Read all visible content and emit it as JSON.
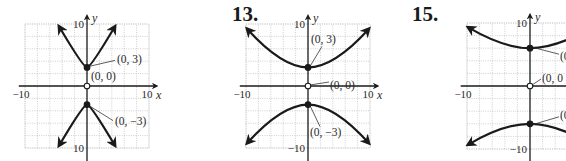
{
  "chart_data": [
    {
      "type": "line",
      "panel": "left",
      "problem_number": "",
      "title": "",
      "xlabel": "x",
      "ylabel": "y",
      "xlim": [
        -10,
        10
      ],
      "ylim": [
        -10,
        10
      ],
      "grid": true,
      "tick_labels": {
        "x_min": "−10",
        "x_max": "10",
        "y_max": "10",
        "y_min": "10"
      },
      "origin_px": [
        87,
        86
      ],
      "unit_px": 6.2,
      "series": [
        {
          "name": "upper branch",
          "vertex": [
            0,
            3
          ],
          "ends": [
            [
              -4.5,
              9.6
            ],
            [
              4.5,
              9.6
            ]
          ],
          "shape": "steep"
        },
        {
          "name": "lower branch",
          "vertex": [
            0,
            -3
          ],
          "ends": [
            [
              -4.5,
              -9.6
            ],
            [
              4.5,
              -9.6
            ]
          ],
          "shape": "steep"
        }
      ],
      "points": [
        {
          "label": "(0, 3)",
          "x": 0,
          "y": 3,
          "filled": true
        },
        {
          "label": "(0, 0)",
          "x": 0,
          "y": 0,
          "filled": false
        },
        {
          "label": "(0, −3)",
          "x": 0,
          "y": -3,
          "filled": true
        }
      ]
    },
    {
      "type": "line",
      "panel": "middle",
      "problem_number": "13.",
      "title": "",
      "xlabel": "x",
      "ylabel": "y",
      "xlim": [
        -10,
        10
      ],
      "ylim": [
        -10,
        10
      ],
      "grid": true,
      "tick_labels": {
        "x_min": "−10",
        "x_max": "10",
        "y_max": "10",
        "y_min": "−10"
      },
      "origin_px": [
        308,
        86
      ],
      "unit_px": 6.2,
      "series": [
        {
          "name": "upper branch",
          "vertex": [
            0,
            3
          ],
          "ends": [
            [
              -9.8,
              9.2
            ],
            [
              9.8,
              9.2
            ]
          ],
          "shape": "wide"
        },
        {
          "name": "lower branch",
          "vertex": [
            0,
            -3
          ],
          "ends": [
            [
              -9.8,
              -9.2
            ],
            [
              9.8,
              -9.2
            ]
          ],
          "shape": "wide"
        }
      ],
      "points": [
        {
          "label": "(0, 3)",
          "x": 0,
          "y": 3,
          "filled": true
        },
        {
          "label": "(0, 0)",
          "x": 0,
          "y": 0,
          "filled": false
        },
        {
          "label": "(0, −3)",
          "x": 0,
          "y": -3,
          "filled": true
        }
      ]
    },
    {
      "type": "line",
      "panel": "right",
      "problem_number": "15.",
      "title": "",
      "xlabel": "x",
      "ylabel": "y",
      "xlim": [
        -10,
        10
      ],
      "ylim": [
        -10,
        10
      ],
      "grid": true,
      "tick_labels": {
        "x_min": "−10",
        "x_max": "",
        "y_max": "10",
        "y_min": "−10"
      },
      "origin_px": [
        530,
        86
      ],
      "unit_px": 6.3,
      "series": [
        {
          "name": "upper branch",
          "vertex": [
            0,
            6
          ],
          "ends": [
            [
              -9.8,
              9.3
            ],
            [
              9.8,
              9.3
            ]
          ],
          "shape": "wide"
        },
        {
          "name": "lower branch",
          "vertex": [
            0,
            -6
          ],
          "ends": [
            [
              -9.8,
              -9.3
            ],
            [
              9.8,
              -9.3
            ]
          ],
          "shape": "wide"
        }
      ],
      "points": [
        {
          "label": "(0",
          "x": 0,
          "y": 6,
          "filled": true
        },
        {
          "label": "(0, 0",
          "x": 0,
          "y": 0,
          "filled": false
        },
        {
          "label": "(0",
          "x": 0,
          "y": -6,
          "filled": true
        }
      ]
    }
  ]
}
